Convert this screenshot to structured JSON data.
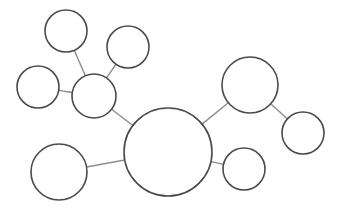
{
  "diagram": {
    "type": "bubble-map",
    "width": 338,
    "height": 211,
    "background": "#ffffff",
    "node_stroke": "#4a4a4a",
    "edge_stroke": "#8c8c8c",
    "nodes": [
      {
        "id": "center",
        "label": "",
        "cx": 168,
        "cy": 152,
        "r": 44
      },
      {
        "id": "hub-left",
        "label": "",
        "cx": 94,
        "cy": 96,
        "r": 22
      },
      {
        "id": "top-left",
        "label": "",
        "cx": 66,
        "cy": 31,
        "r": 21
      },
      {
        "id": "top-mid",
        "label": "",
        "cx": 128,
        "cy": 47,
        "r": 21
      },
      {
        "id": "left",
        "label": "",
        "cx": 38,
        "cy": 87,
        "r": 21
      },
      {
        "id": "upper-right",
        "label": "",
        "cx": 250,
        "cy": 85,
        "r": 28
      },
      {
        "id": "far-right",
        "label": "",
        "cx": 303,
        "cy": 133,
        "r": 21
      },
      {
        "id": "lower-right",
        "label": "",
        "cx": 244,
        "cy": 169,
        "r": 21
      },
      {
        "id": "lower-left",
        "label": "",
        "cx": 59,
        "cy": 172,
        "r": 28
      }
    ],
    "edges": [
      {
        "from": "center",
        "to": "hub-left"
      },
      {
        "from": "hub-left",
        "to": "top-left"
      },
      {
        "from": "hub-left",
        "to": "top-mid"
      },
      {
        "from": "hub-left",
        "to": "left"
      },
      {
        "from": "center",
        "to": "upper-right"
      },
      {
        "from": "upper-right",
        "to": "far-right"
      },
      {
        "from": "center",
        "to": "lower-right"
      },
      {
        "from": "center",
        "to": "lower-left"
      }
    ]
  }
}
